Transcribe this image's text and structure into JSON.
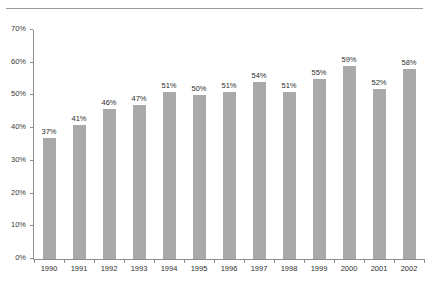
{
  "figure": {
    "has_top_rule": true,
    "background": "#ffffff"
  },
  "chart_data": {
    "type": "bar",
    "title": "",
    "xlabel": "",
    "ylabel": "",
    "categories": [
      "1990",
      "1991",
      "1992",
      "1993",
      "1994",
      "1995",
      "1996",
      "1997",
      "1998",
      "1999",
      "2000",
      "2001",
      "2002"
    ],
    "values": [
      37,
      41,
      46,
      47,
      51,
      50,
      51,
      54,
      51,
      55,
      59,
      52,
      58
    ],
    "data_labels": [
      "37%",
      "41%",
      "46%",
      "47%",
      "51%",
      "50%",
      "51%",
      "54%",
      "51%",
      "55%",
      "59%",
      "52%",
      "58%"
    ],
    "ylim": [
      0,
      70
    ],
    "yticks": [
      0,
      10,
      20,
      30,
      40,
      50,
      60,
      70
    ],
    "ytick_labels": [
      "0%",
      "10%",
      "20%",
      "30%",
      "40%",
      "50%",
      "60%",
      "70%"
    ],
    "grid": false,
    "legend": null,
    "bar_color": "#a9a9a9",
    "axis_color": "#8e8e8e",
    "text_color": "#2e2e2e"
  }
}
